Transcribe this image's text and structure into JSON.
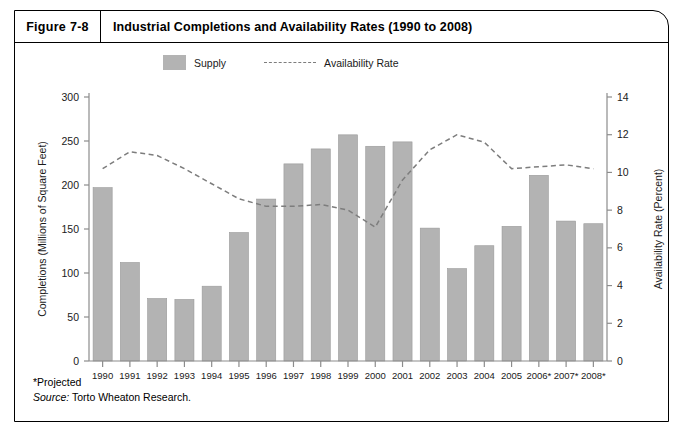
{
  "figure": {
    "number_label": "Figure 7-8",
    "title": "Industrial Completions and Availability Rates (1990 to 2008)"
  },
  "legend": {
    "supply_label": "Supply",
    "availability_label": "Availability Rate"
  },
  "footer": {
    "projected_note": "*Projected",
    "source_label": "Source:",
    "source_text": " Torto Wheaton Research."
  },
  "colors": {
    "bar_fill": "#b3b3b3",
    "bar_stroke": "#9a9a9a",
    "line": "#7d7d7d",
    "axis": "#8c8c8c",
    "text": "#1a1a1a",
    "frame": "#000000"
  },
  "chart_data": {
    "type": "bar",
    "title": "Industrial Completions and Availability Rates (1990 to 2008)",
    "xlabel": "",
    "ylabel": "Completions (Millions of Square Feet)",
    "y2label": "Availability Rate (Percent)",
    "ylim": [
      0,
      300
    ],
    "y2lim": [
      0,
      14
    ],
    "yticks": [
      0,
      50,
      100,
      150,
      200,
      250,
      300
    ],
    "y2ticks": [
      0,
      2,
      4,
      6,
      8,
      10,
      12,
      14
    ],
    "grid": false,
    "legend_position": "top-left",
    "categories": [
      "1990",
      "1991",
      "1992",
      "1993",
      "1994",
      "1995",
      "1996",
      "1997",
      "1998",
      "1999",
      "2000",
      "2001",
      "2002",
      "2003",
      "2004",
      "2005",
      "2006*",
      "2007*",
      "2008*"
    ],
    "series": [
      {
        "name": "Supply",
        "type": "bar",
        "axis": "left",
        "units": "Millions of Square Feet",
        "values": [
          197,
          112,
          71,
          70,
          85,
          146,
          184,
          224,
          241,
          257,
          244,
          249,
          151,
          105,
          131,
          153,
          211,
          159,
          156
        ]
      },
      {
        "name": "Availability Rate",
        "type": "line",
        "axis": "right",
        "units": "Percent",
        "style": "dashed",
        "values": [
          10.2,
          11.1,
          10.9,
          10.2,
          9.4,
          8.6,
          8.2,
          8.2,
          8.3,
          8.0,
          7.1,
          9.6,
          11.2,
          12.0,
          11.6,
          10.2,
          10.3,
          10.4,
          10.2
        ]
      }
    ],
    "annotations": [
      "*Projected",
      "Source: Torto Wheaton Research."
    ]
  }
}
